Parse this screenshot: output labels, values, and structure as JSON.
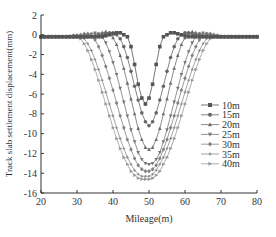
{
  "chart_data": {
    "type": "line",
    "title": "",
    "xlabel": "Mileage(m)",
    "ylabel": "Track slab settlement displacement(mm)",
    "xlim": [
      20,
      80
    ],
    "ylim": [
      -16,
      2
    ],
    "xticks": [
      20,
      30,
      40,
      50,
      60,
      70,
      80
    ],
    "yticks": [
      2,
      0,
      -2,
      -4,
      -6,
      -8,
      -10,
      -12,
      -14,
      -16
    ],
    "grid": false,
    "legend_position": "right-center",
    "x": [
      20,
      21,
      22,
      23,
      24,
      25,
      26,
      27,
      28,
      29,
      30,
      31,
      32,
      33,
      34,
      35,
      36,
      37,
      38,
      39,
      40,
      41,
      42,
      43,
      44,
      45,
      46,
      47,
      48,
      49,
      50,
      51,
      52,
      53,
      54,
      55,
      56,
      57,
      58,
      59,
      60,
      61,
      62,
      63,
      64,
      65,
      66,
      67,
      68,
      69,
      70,
      71,
      72,
      73,
      74,
      75,
      76,
      77,
      78,
      79,
      80
    ],
    "series": [
      {
        "name": "10m",
        "marker": "square",
        "color": "#555555",
        "values": [
          -0.2,
          -0.2,
          -0.2,
          -0.2,
          -0.2,
          -0.2,
          -0.2,
          -0.2,
          -0.2,
          -0.2,
          -0.2,
          -0.2,
          -0.2,
          -0.2,
          -0.2,
          -0.2,
          -0.2,
          -0.2,
          -0.1,
          0.0,
          0.1,
          0.2,
          0.2,
          0.0,
          -0.2,
          -1.2,
          -3.0,
          -5.0,
          -6.4,
          -7.0,
          -6.4,
          -5.0,
          -3.0,
          -1.2,
          -0.2,
          0.0,
          0.2,
          0.2,
          0.1,
          0.0,
          -0.1,
          -0.2,
          -0.2,
          -0.2,
          -0.2,
          -0.2,
          -0.2,
          -0.2,
          -0.2,
          -0.2,
          -0.2,
          -0.2,
          -0.2,
          -0.2,
          -0.2,
          -0.2,
          -0.2,
          -0.2,
          -0.2,
          -0.2,
          -0.2
        ]
      },
      {
        "name": "15m",
        "marker": "circle",
        "color": "#666666",
        "values": [
          -0.2,
          -0.2,
          -0.2,
          -0.2,
          -0.2,
          -0.2,
          -0.2,
          -0.2,
          -0.2,
          -0.2,
          -0.2,
          -0.2,
          -0.2,
          -0.2,
          -0.2,
          -0.2,
          -0.1,
          0.0,
          0.1,
          0.2,
          0.2,
          0.0,
          -0.4,
          -1.2,
          -2.3,
          -3.7,
          -5.2,
          -6.6,
          -7.9,
          -8.8,
          -9.2,
          -8.8,
          -7.9,
          -6.6,
          -5.2,
          -3.7,
          -2.3,
          -1.2,
          -0.4,
          0.0,
          0.2,
          0.2,
          0.1,
          0.0,
          -0.1,
          -0.2,
          -0.2,
          -0.2,
          -0.2,
          -0.2,
          -0.2,
          -0.2,
          -0.2,
          -0.2,
          -0.2,
          -0.2,
          -0.2,
          -0.2,
          -0.2,
          -0.2,
          -0.2
        ]
      },
      {
        "name": "20m",
        "marker": "triangle-up",
        "color": "#6e6e6e",
        "values": [
          -0.2,
          -0.2,
          -0.2,
          -0.2,
          -0.2,
          -0.2,
          -0.2,
          -0.2,
          -0.2,
          -0.2,
          -0.2,
          -0.2,
          -0.2,
          -0.2,
          -0.1,
          0.0,
          0.1,
          0.2,
          0.3,
          0.1,
          -0.3,
          -1.0,
          -2.1,
          -3.4,
          -4.9,
          -6.5,
          -8.0,
          -9.5,
          -10.6,
          -11.4,
          -11.6,
          -11.4,
          -10.6,
          -9.5,
          -8.0,
          -6.5,
          -4.9,
          -3.4,
          -2.1,
          -1.0,
          -0.3,
          0.1,
          0.3,
          0.2,
          0.1,
          0.0,
          -0.1,
          -0.2,
          -0.2,
          -0.2,
          -0.2,
          -0.2,
          -0.2,
          -0.2,
          -0.2,
          -0.2,
          -0.2,
          -0.2,
          -0.2,
          -0.2,
          -0.2
        ]
      },
      {
        "name": "25m",
        "marker": "triangle-down",
        "color": "#777777",
        "values": [
          -0.2,
          -0.2,
          -0.2,
          -0.2,
          -0.2,
          -0.2,
          -0.2,
          -0.2,
          -0.2,
          -0.2,
          -0.2,
          -0.2,
          -0.1,
          0.0,
          0.1,
          0.2,
          0.1,
          -0.2,
          -0.8,
          -1.7,
          -2.8,
          -4.0,
          -5.4,
          -6.8,
          -8.2,
          -9.6,
          -10.8,
          -11.9,
          -12.6,
          -13.0,
          -13.1,
          -13.0,
          -12.6,
          -11.9,
          -10.8,
          -9.6,
          -8.2,
          -6.8,
          -5.4,
          -4.0,
          -2.8,
          -1.7,
          -0.8,
          -0.2,
          0.1,
          0.2,
          0.1,
          0.0,
          -0.1,
          -0.2,
          -0.2,
          -0.2,
          -0.2,
          -0.2,
          -0.2,
          -0.2,
          -0.2,
          -0.2,
          -0.2,
          -0.2,
          -0.2
        ]
      },
      {
        "name": "30m",
        "marker": "diamond",
        "color": "#828282",
        "values": [
          -0.2,
          -0.2,
          -0.2,
          -0.2,
          -0.2,
          -0.2,
          -0.2,
          -0.2,
          -0.2,
          -0.2,
          -0.1,
          0.0,
          0.1,
          0.1,
          -0.1,
          -0.5,
          -1.2,
          -2.1,
          -3.2,
          -4.4,
          -5.6,
          -6.9,
          -8.2,
          -9.4,
          -10.6,
          -11.6,
          -12.5,
          -13.2,
          -13.6,
          -13.8,
          -13.8,
          -13.6,
          -13.2,
          -12.5,
          -11.6,
          -10.6,
          -9.4,
          -8.2,
          -6.9,
          -5.6,
          -4.4,
          -3.2,
          -2.1,
          -1.2,
          -0.5,
          -0.1,
          0.1,
          0.1,
          0.0,
          -0.1,
          -0.2,
          -0.2,
          -0.2,
          -0.2,
          -0.2,
          -0.2,
          -0.2,
          -0.2,
          -0.2,
          -0.2,
          -0.2
        ]
      },
      {
        "name": "35m",
        "marker": "star",
        "color": "#8e8e8e",
        "values": [
          -0.2,
          -0.2,
          -0.2,
          -0.2,
          -0.2,
          -0.2,
          -0.2,
          -0.2,
          -0.1,
          0.0,
          0.0,
          -0.1,
          -0.4,
          -0.9,
          -1.6,
          -2.5,
          -3.5,
          -4.6,
          -5.8,
          -7.0,
          -8.2,
          -9.4,
          -10.5,
          -11.5,
          -12.4,
          -13.1,
          -13.7,
          -14.1,
          -14.3,
          -14.3,
          -14.3,
          -14.1,
          -13.7,
          -13.1,
          -12.4,
          -11.5,
          -10.5,
          -9.4,
          -8.2,
          -7.0,
          -5.8,
          -4.6,
          -3.5,
          -2.5,
          -1.6,
          -0.9,
          -0.4,
          -0.1,
          0.0,
          0.0,
          -0.1,
          -0.2,
          -0.2,
          -0.2,
          -0.2,
          -0.2,
          -0.2,
          -0.2,
          -0.2,
          -0.2,
          -0.2
        ]
      },
      {
        "name": "40m",
        "marker": "triangle-right",
        "color": "#9a9a9a",
        "values": [
          -0.2,
          -0.2,
          -0.2,
          -0.2,
          -0.2,
          -0.2,
          -0.2,
          -0.2,
          -0.2,
          -0.2,
          -0.2,
          -0.4,
          -0.9,
          -1.6,
          -2.5,
          -3.5,
          -4.6,
          -5.8,
          -7.0,
          -8.2,
          -9.4,
          -10.5,
          -11.5,
          -12.4,
          -13.1,
          -13.8,
          -14.2,
          -14.5,
          -14.6,
          -14.6,
          -14.6,
          -14.5,
          -14.2,
          -13.8,
          -13.1,
          -12.4,
          -11.5,
          -10.5,
          -9.4,
          -8.2,
          -7.0,
          -5.8,
          -4.6,
          -3.5,
          -2.5,
          -1.6,
          -0.9,
          -0.4,
          -0.2,
          -0.2,
          -0.2,
          -0.2,
          -0.2,
          -0.2,
          -0.2,
          -0.2,
          -0.2,
          -0.2,
          -0.2,
          -0.2,
          -0.2
        ]
      }
    ]
  }
}
